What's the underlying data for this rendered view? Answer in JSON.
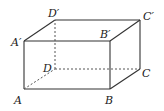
{
  "diagram": {
    "type": "rectangular-prism",
    "vertices": {
      "A": {
        "label": "A",
        "x": 24,
        "y": 89
      },
      "B": {
        "label": "B",
        "x": 110,
        "y": 89
      },
      "C": {
        "label": "C",
        "x": 140,
        "y": 69
      },
      "D": {
        "label": "D",
        "x": 55,
        "y": 69
      },
      "A1": {
        "label": "A′",
        "x": 24,
        "y": 41
      },
      "B1": {
        "label": "B′",
        "x": 110,
        "y": 41
      },
      "C1": {
        "label": "C′",
        "x": 140,
        "y": 20
      },
      "D1": {
        "label": "D′",
        "x": 55,
        "y": 20
      }
    },
    "visible_edges": [
      "A-B",
      "B-C",
      "A-A′",
      "B-B′",
      "C-C′",
      "A′-B′",
      "B′-C′",
      "C′-D′",
      "D′-A′"
    ],
    "hidden_edges": [
      "A-D",
      "D-C",
      "D-D′"
    ],
    "colors": {
      "line": "#333333",
      "background": "#ffffff"
    }
  }
}
